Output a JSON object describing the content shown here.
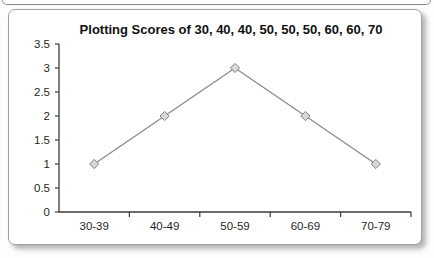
{
  "chart_data": {
    "type": "line",
    "title": "Plotting Scores of 30, 40, 40, 50, 50, 50, 60, 60, 70",
    "categories": [
      "30-39",
      "40-49",
      "50-59",
      "60-69",
      "70-79"
    ],
    "values": [
      1,
      2,
      3,
      2,
      1
    ],
    "xlabel": "",
    "ylabel": "",
    "ylim": [
      0,
      3.5
    ],
    "ytick_step": 0.5,
    "ytick_labels": [
      "0",
      "0.5",
      "1",
      "1.5",
      "2",
      "2.5",
      "3",
      "3.5"
    ],
    "grid": false,
    "legend": "none",
    "marker": "diamond",
    "colors": {
      "line": "#8c8c8c",
      "marker_fill": "#d9d9d9",
      "marker_stroke": "#7f7f7f",
      "axis": "#3a3a3a",
      "tick": "#3a3a3a",
      "label_text": "#1f1f1f",
      "title_text": "#111111",
      "card_border": "#9f9f9f",
      "card_background": "#ffffff"
    }
  }
}
